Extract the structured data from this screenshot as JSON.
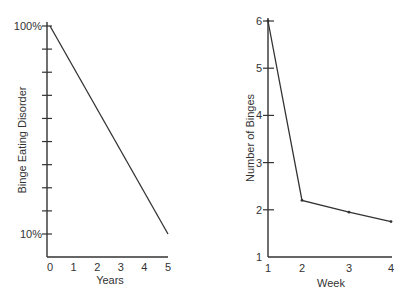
{
  "chart_data": [
    {
      "type": "line",
      "title": "",
      "xlabel": "Years",
      "ylabel": "Binge Eating Disorder",
      "x": [
        0,
        3,
        5
      ],
      "xticks": [
        "0",
        "1",
        "2",
        "3",
        "4",
        "5"
      ],
      "yticks_labeled": [
        "100%",
        "10%"
      ],
      "ytick_count": 10,
      "xlim": [
        0,
        5
      ],
      "ylim": [
        10,
        100
      ],
      "series": [
        {
          "name": "Binge Eating Disorder",
          "values": [
            100,
            46,
            10
          ]
        }
      ],
      "grid": false,
      "legend": "none"
    },
    {
      "type": "line",
      "title": "",
      "xlabel": "Week",
      "ylabel": "Number of Binges",
      "x": [
        1,
        2,
        3,
        4
      ],
      "xticks": [
        "1",
        "2",
        "3",
        "4"
      ],
      "yticks": [
        "1",
        "2",
        "3",
        "4",
        "5",
        "6"
      ],
      "xlim": [
        1,
        4
      ],
      "ylim": [
        1,
        6
      ],
      "series": [
        {
          "name": "Number of Binges",
          "values": [
            6.0,
            2.2,
            1.95,
            1.75
          ]
        }
      ],
      "grid": false,
      "legend": "none"
    }
  ],
  "left": {
    "ylabel": "Binge Eating Disorder",
    "xlabel": "Years",
    "ytop": "100%",
    "ybottom": "10%",
    "xticks": [
      "0",
      "1",
      "2",
      "3",
      "4",
      "5"
    ]
  },
  "right": {
    "ylabel": "Number of Binges",
    "xlabel": "Week",
    "yticks": [
      "1",
      "2",
      "3",
      "4",
      "5",
      "6"
    ],
    "xticks": [
      "1",
      "2",
      "3",
      "4"
    ]
  }
}
